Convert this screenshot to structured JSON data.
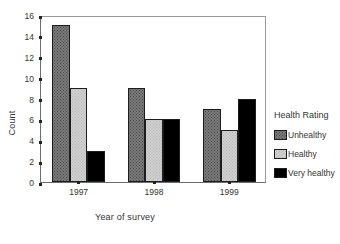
{
  "chart_data": {
    "type": "bar",
    "title": "",
    "xlabel": "Year of survey",
    "ylabel": "Count",
    "categories": [
      "1997",
      "1998",
      "1999"
    ],
    "series": [
      {
        "name": "Unhealthy",
        "values": [
          15,
          9,
          7
        ],
        "color": "#7a7a7a"
      },
      {
        "name": "Healthy",
        "values": [
          9,
          6,
          5
        ],
        "color": "#cfcfcf"
      },
      {
        "name": "Very healthy",
        "values": [
          3,
          6,
          8
        ],
        "color": "#000000"
      }
    ],
    "ylim": [
      0,
      16
    ],
    "yticks": [
      0,
      2,
      4,
      6,
      8,
      10,
      12,
      14,
      16
    ],
    "ytick_labels": [
      "0",
      "2",
      "4",
      "6",
      "8",
      "10",
      "12",
      "14",
      "16"
    ],
    "grid": false,
    "legend_position": "right",
    "legend_title": "Health Rating"
  },
  "legend": {
    "title": "Health Rating",
    "items": [
      {
        "label": "Unhealthy",
        "style": "unhealthy"
      },
      {
        "label": "Healthy",
        "style": "healthy"
      },
      {
        "label": "Very healthy",
        "style": "veryhealthy"
      }
    ]
  },
  "axes": {
    "y_title": "Count",
    "x_title": "Year of survey"
  }
}
